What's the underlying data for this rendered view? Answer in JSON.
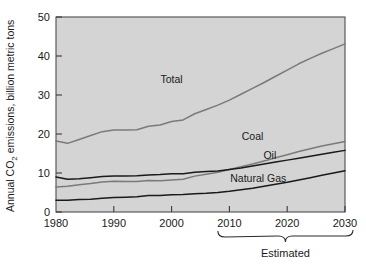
{
  "chart_data": {
    "type": "line",
    "title": "",
    "subtitle": "",
    "xlabel": "",
    "ylabel": "Annual CO₂ emissions, billion metric tons",
    "ylabel_parts": {
      "prefix": "Annual CO",
      "sub": "2",
      "suffix": " emissions, billion metric tons"
    },
    "xlim": [
      1980,
      2030
    ],
    "ylim": [
      0,
      50
    ],
    "xticks": [
      1980,
      1990,
      2000,
      2010,
      2020,
      2030
    ],
    "xtick_labels": [
      "1980",
      "1990",
      "2000",
      "2010",
      "2020",
      "2030"
    ],
    "yticks": [
      0,
      10,
      20,
      30,
      40,
      50
    ],
    "ytick_labels": [
      "0",
      "10",
      "20",
      "30",
      "40",
      "50"
    ],
    "grid": false,
    "legend_position": "inline-labels",
    "plot_background": "#d4d4d4",
    "figure_background": "#ffffff",
    "annotations": [
      {
        "text": "Estimated",
        "x_range": [
          2008,
          2031
        ],
        "note": "brace under x-axis spanning forecast period"
      }
    ],
    "series": [
      {
        "name": "Total",
        "color": "#7a7a7a",
        "label_x": 2000,
        "label_y": 33,
        "x": [
          1980,
          1982,
          1984,
          1986,
          1988,
          1990,
          1992,
          1994,
          1996,
          1998,
          2000,
          2002,
          2004,
          2006,
          2008,
          2010,
          2012,
          2014,
          2016,
          2018,
          2020,
          2022,
          2024,
          2026,
          2028,
          2030
        ],
        "y": [
          18.2,
          17.6,
          18.6,
          19.6,
          20.6,
          21.0,
          21.0,
          21.1,
          22.0,
          22.3,
          23.2,
          23.6,
          25.2,
          26.3,
          27.4,
          28.7,
          30.2,
          31.7,
          33.2,
          34.8,
          36.4,
          38.0,
          39.4,
          40.7,
          41.9,
          43.1
        ]
      },
      {
        "name": "Coal",
        "color": "#7a7a7a",
        "label_x": 2014,
        "label_y": 18.5,
        "x": [
          1980,
          1982,
          1984,
          1986,
          1988,
          1990,
          1992,
          1994,
          1996,
          1998,
          2000,
          2002,
          2004,
          2006,
          2008,
          2010,
          2012,
          2014,
          2016,
          2018,
          2020,
          2022,
          2024,
          2026,
          2028,
          2030
        ],
        "y": [
          6.4,
          6.6,
          7.0,
          7.3,
          7.7,
          7.9,
          7.8,
          7.8,
          8.1,
          8.0,
          8.2,
          8.4,
          9.2,
          9.7,
          10.2,
          10.9,
          11.6,
          12.3,
          13.1,
          13.9,
          14.7,
          15.5,
          16.2,
          16.9,
          17.5,
          18.1
        ]
      },
      {
        "name": "Oil",
        "color": "#1a1a1a",
        "label_x": 2017,
        "label_y": 13.6,
        "x": [
          1980,
          1982,
          1984,
          1986,
          1988,
          1990,
          1992,
          1994,
          1996,
          1998,
          2000,
          2002,
          2004,
          2006,
          2008,
          2010,
          2012,
          2014,
          2016,
          2018,
          2020,
          2022,
          2024,
          2026,
          2028,
          2030
        ],
        "y": [
          9.0,
          8.4,
          8.5,
          8.8,
          9.1,
          9.2,
          9.2,
          9.3,
          9.5,
          9.6,
          9.8,
          9.8,
          10.2,
          10.4,
          10.5,
          10.9,
          11.3,
          11.8,
          12.3,
          12.8,
          13.3,
          13.8,
          14.3,
          14.8,
          15.3,
          15.8
        ]
      },
      {
        "name": "Natural Gas",
        "color": "#1a1a1a",
        "label_x": 2015,
        "label_y": 7.8,
        "x": [
          1980,
          1982,
          1984,
          1986,
          1988,
          1990,
          1992,
          1994,
          1996,
          1998,
          2000,
          2002,
          2004,
          2006,
          2008,
          2010,
          2012,
          2014,
          2016,
          2018,
          2020,
          2022,
          2024,
          2026,
          2028,
          2030
        ],
        "y": [
          3.0,
          3.0,
          3.2,
          3.3,
          3.5,
          3.7,
          3.8,
          3.9,
          4.2,
          4.2,
          4.4,
          4.5,
          4.7,
          4.8,
          5.0,
          5.3,
          5.7,
          6.1,
          6.6,
          7.1,
          7.6,
          8.2,
          8.8,
          9.4,
          10.0,
          10.6
        ]
      }
    ]
  },
  "figure": {
    "ylabel": "Annual CO2 emissions, billion metric tons",
    "estimated_label": "Estimated"
  }
}
